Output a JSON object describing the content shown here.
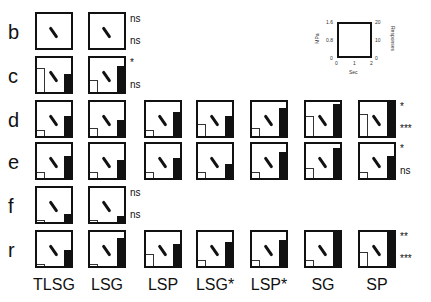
{
  "rows": [
    {
      "label": "b",
      "top": 12,
      "cells": [
        0,
        1
      ],
      "sig": [
        "ns",
        "ns"
      ]
    },
    {
      "label": "c",
      "top": 56,
      "cells": [
        0,
        1
      ],
      "sig": [
        "*",
        "ns"
      ]
    },
    {
      "label": "d",
      "top": 100,
      "cells": [
        0,
        1,
        2,
        3,
        4,
        5,
        6
      ],
      "sig": [
        "*",
        "***"
      ]
    },
    {
      "label": "e",
      "top": 142,
      "cells": [
        0,
        1,
        2,
        3,
        4,
        5,
        6
      ],
      "sig": [
        "*",
        "ns"
      ]
    },
    {
      "label": "f",
      "top": 186,
      "cells": [
        0,
        1
      ],
      "sig": [
        "ns",
        "ns"
      ]
    },
    {
      "label": "r",
      "top": 230,
      "cells": [
        0,
        1,
        2,
        3,
        4,
        5,
        6
      ],
      "sig": [
        "**",
        "***"
      ]
    }
  ],
  "columns": [
    "TLSG",
    "LSG",
    "LSP",
    "LSG*",
    "LSP*",
    "SG",
    "SP"
  ],
  "inset": {
    "left_axis_label": "MPa",
    "left_ticks": [
      "1.6",
      "0.8",
      "0"
    ],
    "right_axis_label": "Responses",
    "right_ticks": [
      "20",
      "10",
      "0"
    ],
    "x_axis_label": "Sec",
    "x_ticks": [
      "0",
      "1",
      "2"
    ]
  }
}
